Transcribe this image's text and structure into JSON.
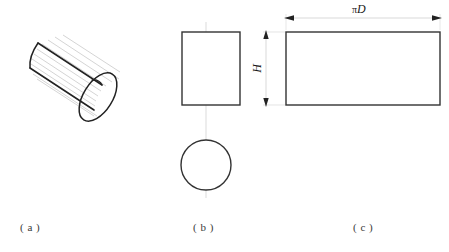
{
  "figure": {
    "line_color": "#222222",
    "hatch_color": "#b9b9b9",
    "center_line_color": "#cccccc",
    "background": "#ffffff"
  },
  "panels": [
    {
      "id": "a",
      "caption": "( a )",
      "description": "pictorial view of cylinder with surface elements",
      "shape": "cylinder-3d"
    },
    {
      "id": "b",
      "caption": "( b )",
      "description": "orthographic views: front rectangle and top circle",
      "shape": "two-view-projection"
    },
    {
      "id": "c",
      "caption": "( c )",
      "description": "developed (unrolled) surface rectangle",
      "shape": "development-rectangle"
    }
  ],
  "dimensions": {
    "height": {
      "label": "H",
      "orientation": "vertical",
      "arrows": "both-ends"
    },
    "width": {
      "symbol": "π",
      "label": "D",
      "orientation": "horizontal",
      "arrows": "both-ends"
    }
  },
  "geometry": {
    "cylinder": {
      "element_lines": 11,
      "axis_angle_deg": 32
    },
    "front_view_rect": {
      "x": 182,
      "y": 32,
      "w": 58,
      "h": 73
    },
    "top_view_circle": {
      "cx": 206,
      "cy": 165,
      "r": 25
    },
    "development_rect": {
      "x": 286,
      "y": 32,
      "w": 154,
      "h": 73
    }
  }
}
